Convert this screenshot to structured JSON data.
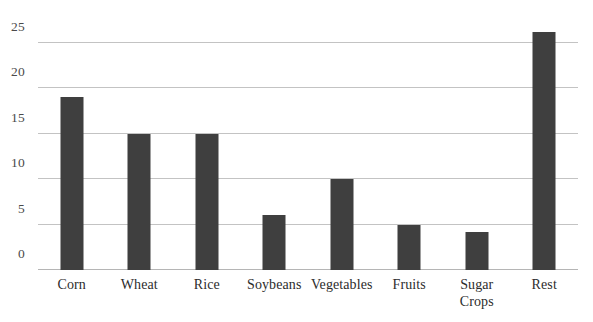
{
  "chart_data": {
    "type": "bar",
    "title": "",
    "subtitle": "",
    "xlabel": "",
    "ylabel": "",
    "categories": [
      "Corn",
      "Wheat",
      "Rice",
      "Soybeans",
      "Vegetables",
      "Fruits",
      "Sugar Crops",
      "Rest"
    ],
    "values": [
      19,
      15,
      15,
      6,
      10,
      5,
      4.2,
      26.2
    ],
    "ylim": [
      0,
      27.5
    ],
    "yticks": [
      0,
      5,
      10,
      15,
      20,
      25
    ],
    "ytick_labels": [
      "0",
      "5",
      "10",
      "15",
      "20",
      "25"
    ],
    "grid": true,
    "legend": false,
    "legend_position": "none",
    "bar_color": "#3f3f3f",
    "gridline_color": "#b9b9b9",
    "background_color": "#ffffff",
    "bars": [
      {
        "label": "Corn",
        "label_lines": [
          "Corn"
        ],
        "value": 19
      },
      {
        "label": "Wheat",
        "label_lines": [
          "Wheat"
        ],
        "value": 15
      },
      {
        "label": "Rice",
        "label_lines": [
          "Rice"
        ],
        "value": 15
      },
      {
        "label": "Soybeans",
        "label_lines": [
          "Soybeans"
        ],
        "value": 6
      },
      {
        "label": "Vegetables",
        "label_lines": [
          "Vegetables"
        ],
        "value": 10
      },
      {
        "label": "Fruits",
        "label_lines": [
          "Fruits"
        ],
        "value": 5
      },
      {
        "label": "Sugar Crops",
        "label_lines": [
          "Sugar",
          "Crops"
        ],
        "value": 4.2
      },
      {
        "label": "Rest",
        "label_lines": [
          "Rest"
        ],
        "value": 26.2
      }
    ]
  }
}
